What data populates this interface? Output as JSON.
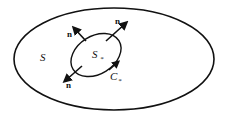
{
  "labels": {
    "outer_surface": "S",
    "inner_surface": "S",
    "inner_surface_sub": "*",
    "curve": "C",
    "curve_sub": "*",
    "normal_1": "n",
    "normal_2": "n",
    "normal_3": "n"
  },
  "colors": {
    "stroke": "#111111",
    "background": "#ffffff"
  }
}
